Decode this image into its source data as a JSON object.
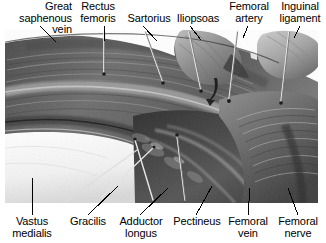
{
  "figure": {
    "type": "anatomical-photograph",
    "region": "Anterior thigh / femoral triangle dissection",
    "image_style": "grayscale cadaver dissection photograph with metal probe pins",
    "background_color": "#ffffff",
    "text_color": "#000000"
  },
  "labels_top": [
    {
      "id": "great-saphenous-vein",
      "text": "Great saphenous\nvein",
      "align": "right"
    },
    {
      "id": "rectus-femoris",
      "text": "Rectus\nfemoris",
      "align": "center"
    },
    {
      "id": "sartorius",
      "text": "Sartorius",
      "align": "center"
    },
    {
      "id": "iliopsoas",
      "text": "Iliopsoas",
      "align": "center"
    },
    {
      "id": "femoral-artery",
      "text": "Femoral\nartery",
      "align": "center"
    },
    {
      "id": "inguinal-ligament",
      "text": "Inguinal\nligament",
      "align": "center"
    }
  ],
  "labels_bottom": [
    {
      "id": "vastus-medialis",
      "text": "Vastus\nmedialis",
      "align": "center"
    },
    {
      "id": "gracilis",
      "text": "Gracilis",
      "align": "center"
    },
    {
      "id": "adductor-longus",
      "text": "Adductor\nlongus",
      "align": "center"
    },
    {
      "id": "pectineus",
      "text": "Pectineus",
      "align": "center"
    },
    {
      "id": "femoral-vein",
      "text": "Femoral\nvein",
      "align": "center"
    },
    {
      "id": "femoral-nerve",
      "text": "Femoral\nnerve",
      "align": "center"
    }
  ],
  "leader_lines": {
    "count": 12,
    "color": "#000000",
    "width_px": 1
  },
  "photo": {
    "x": 5,
    "y": 30,
    "width": 313,
    "height": 173
  }
}
